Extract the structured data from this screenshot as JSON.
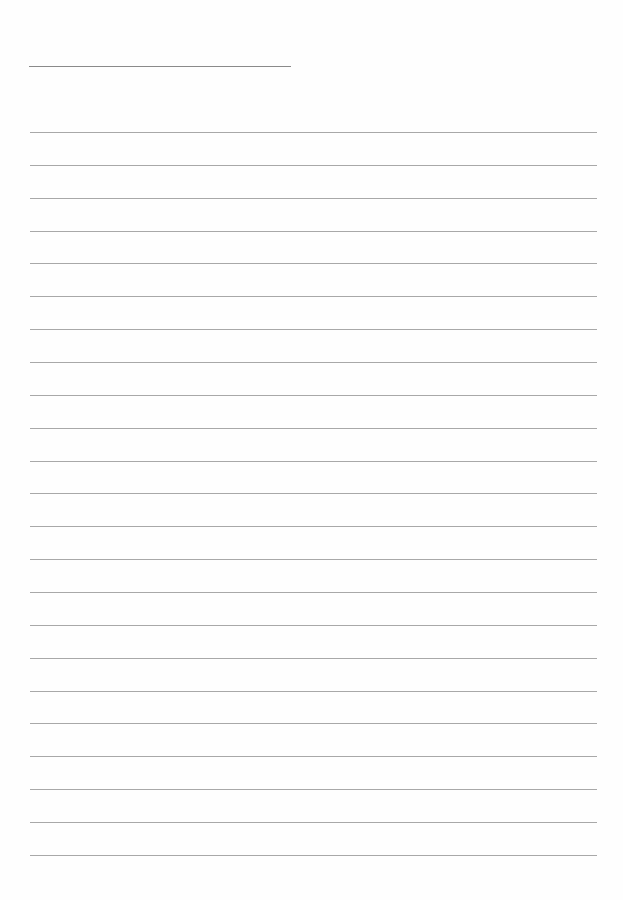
{
  "page": {
    "type": "lined-paper",
    "background_color": "#ffffff",
    "line_color": "#a8a8a8",
    "title_line": {
      "left": 29,
      "top": 66,
      "width": 262
    },
    "rules": {
      "count": 23,
      "first_top": 132,
      "spacing": 32.86,
      "left": 30,
      "width": 567
    }
  }
}
